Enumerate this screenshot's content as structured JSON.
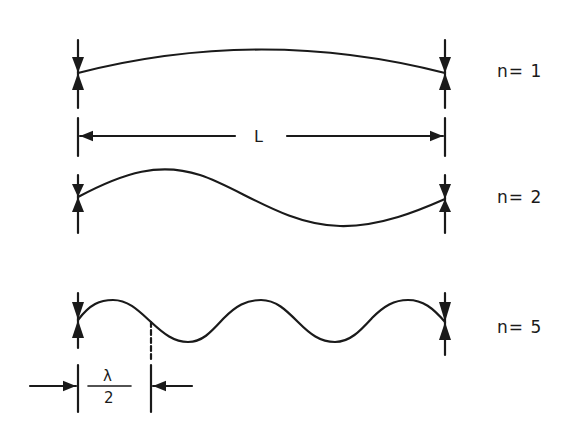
{
  "diagram": {
    "type": "standing-wave-modes",
    "colors": {
      "ink": "#1a1a1a",
      "background": "#ffffff"
    },
    "span": {
      "label": "L"
    },
    "modes": [
      {
        "n": 1,
        "label": "n= 1"
      },
      {
        "n": 2,
        "label": "n= 2"
      },
      {
        "n": 5,
        "label": "n= 5"
      }
    ],
    "half_wavelength": {
      "numerator": "λ",
      "denominator": "2"
    }
  }
}
